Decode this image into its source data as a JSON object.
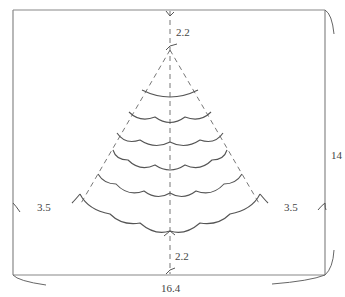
{
  "diagram": {
    "type": "pattern-schematic",
    "colors": {
      "outline": "#888888",
      "scallop": "#555555",
      "dashed": "#777777",
      "text": "#444444",
      "background": "#ffffff"
    },
    "dimensions": {
      "top_gap": "2.2",
      "bottom_gap": "2.2",
      "left_offset": "3.5",
      "right_offset": "3.5",
      "height": "14",
      "width": "16.4"
    },
    "tiers": [
      {
        "index": 1,
        "scallops": 1
      },
      {
        "index": 2,
        "scallops": 2
      },
      {
        "index": 3,
        "scallops": 3
      },
      {
        "index": 4,
        "scallops": 3
      },
      {
        "index": 5,
        "scallops": 4
      },
      {
        "index": 6,
        "scallops": 4
      }
    ]
  }
}
